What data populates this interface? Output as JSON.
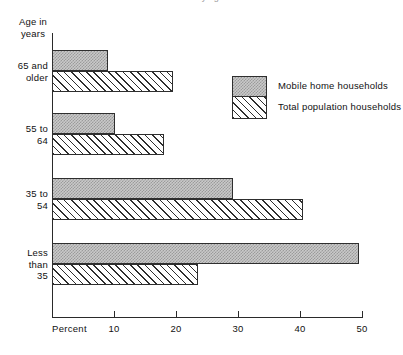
{
  "title_sliver": "Percent distribution by age of householder",
  "axis_caption_line1": "Age in",
  "axis_caption_line2": "years",
  "axis_unit_label": "Percent",
  "legend": {
    "items": [
      {
        "label": "Mobile home households",
        "pattern": "stipple",
        "color": "#c9c9c9"
      },
      {
        "label": "Total population households",
        "pattern": "hatch",
        "color": "#ffffff"
      }
    ]
  },
  "chart_data": {
    "type": "bar",
    "orientation": "horizontal",
    "title": "Percent distribution by age of householder",
    "xlabel": "Percent",
    "ylabel": "Age in years",
    "xlim": [
      0,
      50
    ],
    "xticks": [
      10,
      20,
      30,
      40,
      50
    ],
    "xtick_labels": [
      "10",
      "20",
      "30",
      "40",
      "50"
    ],
    "grid": false,
    "legend_position": "upper-right-inside",
    "categories": [
      "65 and older",
      "55 to 64",
      "35 to 54",
      "Less than 35"
    ],
    "category_label_lines": [
      [
        "65 and",
        "older"
      ],
      [
        "55 to",
        "64"
      ],
      [
        "35 to",
        "54"
      ],
      [
        "Less",
        "than",
        "35"
      ]
    ],
    "series": [
      {
        "name": "Mobile home households",
        "values": [
          9.0,
          10.2,
          29.2,
          49.5
        ]
      },
      {
        "name": "Total population households",
        "values": [
          19.5,
          18.0,
          40.5,
          23.5
        ]
      }
    ]
  },
  "geometry": {
    "x0_px": 52,
    "x_per_unit_px": 6.2,
    "bar_height_px": 21,
    "group_tops_px": [
      50,
      113,
      178,
      243
    ]
  }
}
